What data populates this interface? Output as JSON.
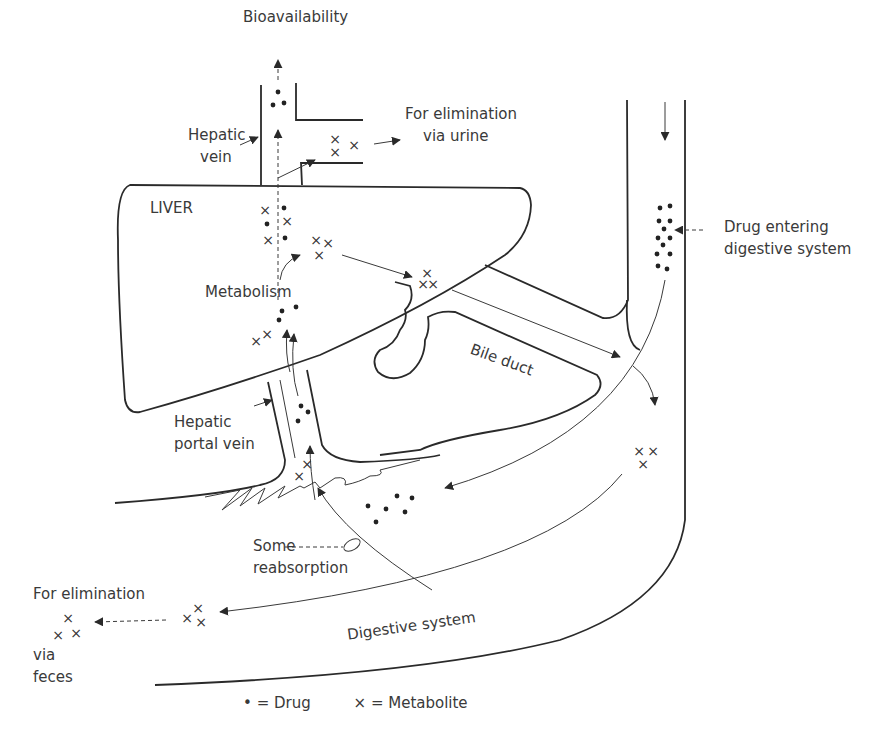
{
  "labels": {
    "bioavailability": "Bioavailability",
    "elimination_urine_1": "For elimination",
    "elimination_urine_2": "via urine",
    "hepatic_vein_1": "Hepatic",
    "hepatic_vein_2": "vein",
    "liver": "LIVER",
    "metabolism": "Metabolism",
    "drug_entering_1": "Drug entering",
    "drug_entering_2": "digestive system",
    "bile_duct": "Bile duct",
    "hepatic_portal_1": "Hepatic",
    "hepatic_portal_2": "portal vein",
    "reabsorption_1": "Some",
    "reabsorption_2": "reabsorption",
    "elimination_feces_1": "For elimination",
    "elimination_feces_2": "via",
    "elimination_feces_3": "feces",
    "digestive_system": "Digestive system"
  },
  "legend": {
    "drug_symbol": "•",
    "drug_label": "= Drug",
    "metabolite_symbol": "×",
    "metabolite_label": "= Metabolite"
  },
  "colors": {
    "line": "#2a2a2a",
    "text": "#3a3a3a",
    "background": "#ffffff"
  }
}
